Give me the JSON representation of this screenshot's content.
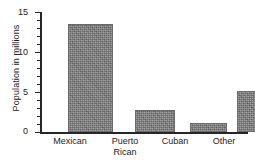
{
  "chart_data": {
    "type": "bar",
    "title": "",
    "subtitle": "",
    "xlabel": "",
    "ylabel": "Population in millions",
    "categories": [
      "Mexican",
      "Puerto Rican",
      "Cuban",
      "Other"
    ],
    "values": [
      13.5,
      2.75,
      1.1,
      5.1
    ],
    "series": [
      {
        "name": "Population in millions",
        "values": [
          13.5,
          2.75,
          1.1,
          5.1
        ]
      }
    ],
    "ylim": [
      0,
      15
    ],
    "xlim": [
      0,
      4
    ],
    "y_major_ticks": [
      0,
      5,
      10,
      15
    ],
    "y_major_tick_labels": [
      "0",
      "5",
      "10",
      "15"
    ],
    "y_minor_tick_interval": 1,
    "grid": false,
    "legend": null,
    "legend_position": "none",
    "annotations": [],
    "bar_color": "#7e7d7e",
    "axis_color": "#262626",
    "background_color": "#ffffff"
  },
  "axis": {
    "y_title": "Population in millions",
    "tick_labels": {
      "t15": "15",
      "t10": "10",
      "t5": "5",
      "t0": "0"
    }
  },
  "categories": {
    "c0": "Mexican",
    "c1": "Puerto\nRican",
    "c2": "Cuban",
    "c3": "Other"
  }
}
